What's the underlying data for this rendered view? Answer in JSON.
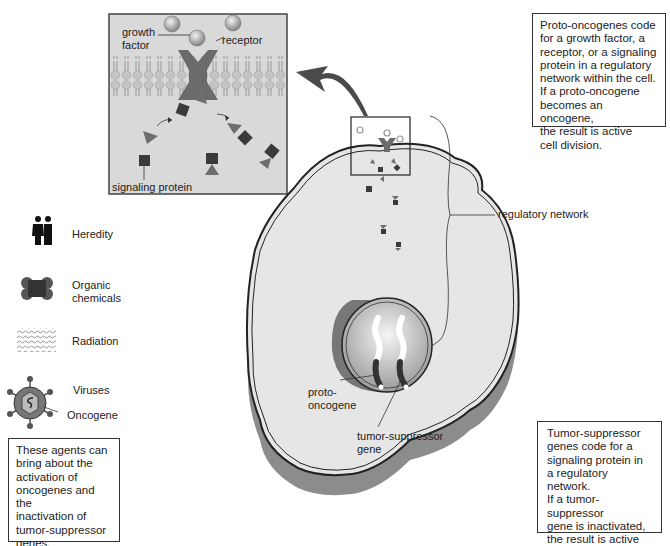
{
  "inset": {
    "growth_factor_label": "growth factor",
    "growth_factor_line1": "growth",
    "growth_factor_line2": "factor",
    "receptor_label": "receptor",
    "signaling_protein_label": "signaling protein"
  },
  "cell": {
    "regulatory_network_label": "regulatory network",
    "proto_oncogene_line1": "proto-",
    "proto_oncogene_line2": "oncogene",
    "tumor_suppressor_line1": "tumor-suppressor",
    "tumor_suppressor_line2": "gene"
  },
  "agents": {
    "items": [
      {
        "label": "Heredity",
        "icon": "couple-icon"
      },
      {
        "label_line1": "Organic",
        "label_line2": "chemicals",
        "icon": "molecule-icon"
      },
      {
        "label": "Radiation",
        "icon": "radiation-waves-icon"
      },
      {
        "label": "Viruses",
        "icon": "virus-icon"
      }
    ],
    "oncogene_label": "Oncogene"
  },
  "notes": {
    "proto_oncogene_box": [
      "Proto-oncogenes code",
      "for a growth factor, a",
      "receptor, or a signaling",
      "protein in a regulatory",
      "network within the cell.",
      "If a proto-oncogene",
      "becomes an oncogene,",
      "the result is active",
      "cell division."
    ],
    "tumor_suppressor_box": [
      "Tumor-suppressor",
      "genes code for a",
      "signaling protein in",
      "a regulatory network.",
      "If a tumor-suppressor",
      "gene is inactivated,",
      "the result is active",
      "cell division."
    ],
    "agents_box": [
      "These agents can",
      "bring about the",
      "activation of",
      "oncogenes and the",
      "inactivation of",
      "tumor-suppressor",
      "genes."
    ]
  },
  "colors": {
    "inset_bg": "#d9d9d9",
    "cytoplasm": "#e6e6e6",
    "cell_shadow": "#8c8c8c",
    "membrane_head": "#bdbdbd",
    "protein_dark": "#3a3a3a",
    "protein_mid": "#6e6e6e",
    "receptor": "#6b6b6b"
  }
}
